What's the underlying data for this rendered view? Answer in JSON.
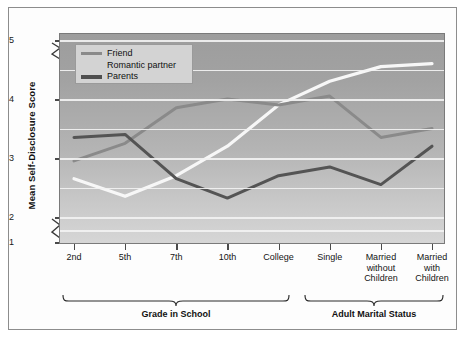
{
  "chart_data": {
    "type": "line",
    "title": "",
    "xlabel": "",
    "ylabel": "Mean Self-Disclosure Score",
    "categories": [
      "2nd",
      "5th",
      "7th",
      "10th",
      "College",
      "Single",
      "Married without Children",
      "Married with Children"
    ],
    "ytick_labels": [
      "1",
      "2",
      "3",
      "4",
      "5"
    ],
    "ytick_values": [
      1,
      2,
      3,
      4,
      5
    ],
    "ylim": [
      1,
      5
    ],
    "y_axis_break": true,
    "grid": true,
    "grid_interval": 0.5,
    "legend_position": "top-left",
    "series": [
      {
        "name": "Friend",
        "color": "#f7f7f7",
        "values": [
          2.65,
          2.35,
          2.7,
          3.2,
          3.9,
          4.3,
          4.55,
          4.6
        ]
      },
      {
        "name": "Romantic partner",
        "color": "#8a8a8a",
        "values": [
          2.95,
          3.25,
          3.85,
          4.0,
          3.9,
          4.05,
          3.35,
          3.5
        ]
      },
      {
        "name": "Parents",
        "color": "#545454",
        "values": [
          3.35,
          3.4,
          2.65,
          2.32,
          2.7,
          2.85,
          2.55,
          3.2
        ]
      }
    ],
    "groups": [
      {
        "label": "Grade in School",
        "categories": [
          "2nd",
          "5th",
          "7th",
          "10th",
          "College"
        ]
      },
      {
        "label": "Adult Marital Status",
        "categories": [
          "Single",
          "Married without Children",
          "Married with Children"
        ]
      }
    ]
  },
  "axis": {
    "y_title": "Mean Self-Disclosure Score"
  },
  "legend": {
    "items": [
      {
        "label": "Friend"
      },
      {
        "label": "Romantic partner"
      },
      {
        "label": "Parents"
      }
    ]
  },
  "groups": {
    "school_label": "Grade in School",
    "adult_label": "Adult Marital Status"
  },
  "colors": {
    "friend": "#f7f7f7",
    "romantic": "#8a8a8a",
    "parents": "#545454",
    "plot_bg_top": "#9d9d9d",
    "plot_bg_bottom": "#d6d6d6",
    "gridline": "#f2f2f2",
    "frame": "#8d8d8d"
  }
}
